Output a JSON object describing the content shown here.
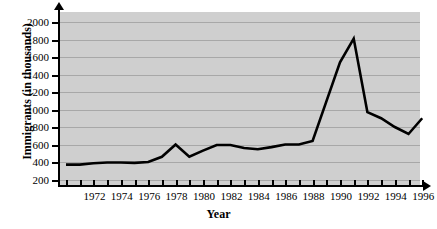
{
  "chart_data": {
    "type": "line",
    "title": "",
    "xlabel": "Year",
    "ylabel": "Immigrants (in thousands)",
    "xlim": [
      1970,
      1996
    ],
    "ylim": [
      0,
      2100
    ],
    "grid": true,
    "legend": null,
    "y_ticks": [
      2000,
      1800,
      1600,
      1400,
      1200,
      1000,
      800,
      600,
      400,
      200
    ],
    "x_ticks": [
      1970,
      1971,
      1972,
      1973,
      1974,
      1975,
      1976,
      1977,
      1978,
      1979,
      1980,
      1981,
      1982,
      1983,
      1984,
      1985,
      1986,
      1987,
      1988,
      1989,
      1990,
      1991,
      1992,
      1993,
      1994,
      1995,
      1996
    ],
    "x_tick_labels": [
      1972,
      1974,
      1976,
      1978,
      1980,
      1982,
      1984,
      1986,
      1988,
      1990,
      1992,
      1994,
      1996
    ],
    "series": [
      {
        "name": "Immigrants",
        "color": "#000000",
        "x": [
          1970,
          1971,
          1972,
          1973,
          1974,
          1975,
          1976,
          1977,
          1978,
          1979,
          1980,
          1981,
          1982,
          1983,
          1984,
          1985,
          1986,
          1987,
          1988,
          1989,
          1990,
          1991,
          1992,
          1993,
          1994,
          1995,
          1996
        ],
        "values": [
          370,
          370,
          385,
          395,
          395,
          390,
          400,
          460,
          600,
          460,
          530,
          595,
          595,
          560,
          545,
          570,
          600,
          600,
          640,
          1090,
          1540,
          1810,
          970,
          900,
          800,
          720,
          900
        ]
      }
    ]
  }
}
